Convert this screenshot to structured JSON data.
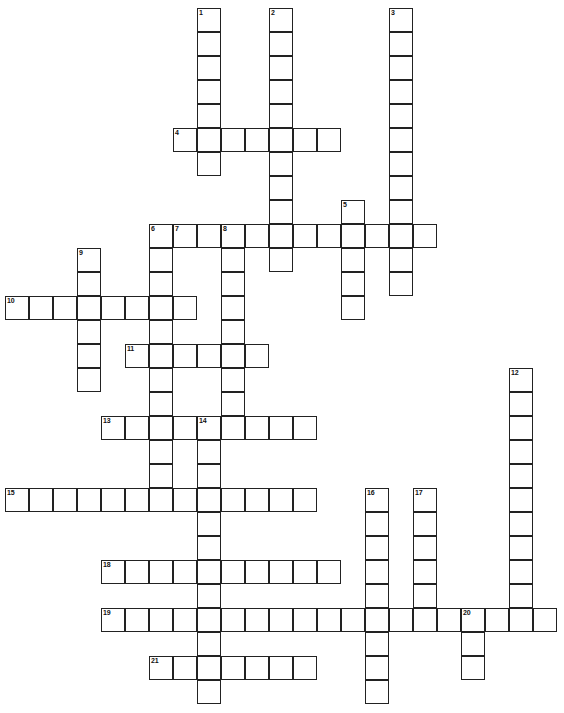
{
  "puzzle": {
    "title": "Crossword Puzzle Grid",
    "type": "crossword",
    "cell_size_px": 24,
    "grid_origin": {
      "x": 5,
      "y": 8
    },
    "grid_columns": 23,
    "grid_rows": 29,
    "colors": {
      "cell_fill": "#ffffff",
      "cell_border": "#222222",
      "number_text": "#111111",
      "page_background": "#ffffff"
    },
    "entries": [
      {
        "number": "1",
        "direction": "down",
        "col": 8,
        "row": 0,
        "length": 7
      },
      {
        "number": "2",
        "direction": "down",
        "col": 11,
        "row": 0,
        "length": 11
      },
      {
        "number": "3",
        "direction": "down",
        "col": 16,
        "row": 0,
        "length": 12
      },
      {
        "number": "4",
        "direction": "across",
        "col": 7,
        "row": 5,
        "length": 7
      },
      {
        "number": "5",
        "direction": "down",
        "col": 14,
        "row": 8,
        "length": 5
      },
      {
        "number": "6",
        "direction": "down",
        "col": 6,
        "row": 9,
        "length": 11
      },
      {
        "number": "7",
        "direction": "across",
        "col": 7,
        "row": 9,
        "length": 11
      },
      {
        "number": "8",
        "direction": "down",
        "col": 9,
        "row": 9,
        "length": 8
      },
      {
        "number": "9",
        "direction": "down",
        "col": 3,
        "row": 10,
        "length": 6
      },
      {
        "number": "10",
        "direction": "across",
        "col": 0,
        "row": 12,
        "length": 8
      },
      {
        "number": "11",
        "direction": "across",
        "col": 5,
        "row": 14,
        "length": 6
      },
      {
        "number": "12",
        "direction": "down",
        "col": 21,
        "row": 15,
        "length": 11
      },
      {
        "number": "13",
        "direction": "across",
        "col": 4,
        "row": 17,
        "length": 9
      },
      {
        "number": "14",
        "direction": "down",
        "col": 8,
        "row": 17,
        "length": 12
      },
      {
        "number": "15",
        "direction": "across",
        "col": 0,
        "row": 20,
        "length": 13
      },
      {
        "number": "16",
        "direction": "down",
        "col": 15,
        "row": 20,
        "length": 9
      },
      {
        "number": "17",
        "direction": "down",
        "col": 17,
        "row": 20,
        "length": 6
      },
      {
        "number": "18",
        "direction": "across",
        "col": 4,
        "row": 23,
        "length": 10
      },
      {
        "number": "19",
        "direction": "across",
        "col": 4,
        "row": 25,
        "length": 19
      },
      {
        "number": "20",
        "direction": "down",
        "col": 19,
        "row": 25,
        "length": 3
      },
      {
        "number": "21",
        "direction": "across",
        "col": 6,
        "row": 27,
        "length": 7
      }
    ]
  }
}
